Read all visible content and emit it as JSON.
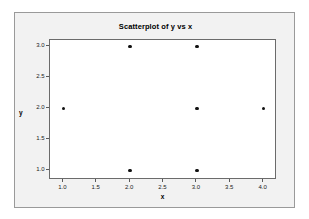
{
  "chart_data": {
    "type": "scatter",
    "title": "Scatterplot of y vs x",
    "xlabel": "x",
    "ylabel": "y",
    "xlim": [
      0.8,
      4.2
    ],
    "ylim": [
      0.85,
      3.1
    ],
    "grid": false,
    "legend": null,
    "x_ticks": [
      "1.0",
      "1.5",
      "2.0",
      "2.5",
      "3.0",
      "3.5",
      "4.0"
    ],
    "x_tick_values": [
      1.0,
      1.5,
      2.0,
      2.5,
      3.0,
      3.5,
      4.0
    ],
    "y_ticks": [
      "1.0",
      "1.5",
      "2.0",
      "2.5",
      "3.0"
    ],
    "y_tick_values": [
      1.0,
      1.5,
      2.0,
      2.5,
      3.0
    ],
    "points": [
      {
        "x": 1.0,
        "y": 2.0
      },
      {
        "x": 2.0,
        "y": 3.0
      },
      {
        "x": 2.0,
        "y": 1.0
      },
      {
        "x": 3.0,
        "y": 3.0
      },
      {
        "x": 3.0,
        "y": 2.0
      },
      {
        "x": 3.0,
        "y": 1.0
      },
      {
        "x": 4.0,
        "y": 2.0
      }
    ],
    "marker_color": "#111111",
    "plot_background": "#ffffff",
    "panel_background": "#f2f2f2",
    "frame_color": "#6b6b6b"
  }
}
